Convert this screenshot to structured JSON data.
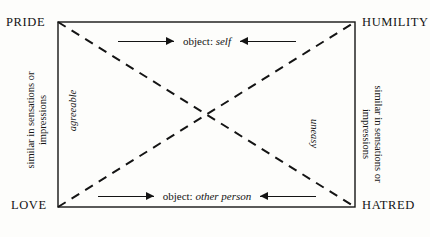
{
  "diagram": {
    "corners": {
      "top_left": "PRIDE",
      "top_right": "HUMILITY",
      "bottom_left": "LOVE",
      "bottom_right": "HATRED"
    },
    "side_labels": {
      "left_outer_line1": "similar in sensations or",
      "left_outer_line2": "impressions",
      "right_outer_line1": "similar in sensations or",
      "right_outer_line2": "impressions",
      "left_inner": "agreeable",
      "right_inner": "uneasy"
    },
    "rows": {
      "top": {
        "object_word": "object:",
        "object_value": "self",
        "left_arrow_icon": "arrow-right-icon",
        "right_arrow_icon": "arrow-left-icon"
      },
      "bottom": {
        "object_word": "object:",
        "object_value": "other person",
        "left_arrow_icon": "arrow-right-icon",
        "right_arrow_icon": "arrow-left-icon"
      }
    },
    "colors": {
      "ink": "#141414",
      "paper": "#fdfdfb"
    },
    "geometry": {
      "rect_left": 58,
      "rect_top": 22,
      "rect_right": 355,
      "rect_bottom": 207,
      "diagonal_style": "dashed",
      "border_style": "solid"
    }
  }
}
